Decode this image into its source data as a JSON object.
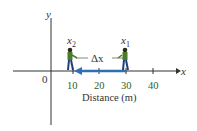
{
  "diagram": {
    "axes": {
      "x_label": "x",
      "y_label": "y",
      "origin_label": "0",
      "x_title": "Distance (m)",
      "ticks": [
        "10",
        "20",
        "30",
        "40"
      ]
    },
    "positions": {
      "x2_label": "x",
      "x2_sub": "2",
      "x1_label": "x",
      "x1_sub": "1"
    },
    "displacement": {
      "label": "Δx",
      "arrow_color": "#2f6fb5"
    },
    "colors": {
      "axis": "#333333",
      "tick_label": "#2e5e1e",
      "person_shirt": "#4a7a2a",
      "person_pants": "#1f3f7a"
    }
  }
}
